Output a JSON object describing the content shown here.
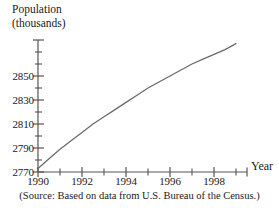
{
  "figure": {
    "y_axis_title_line1": "Population",
    "y_axis_title_line2": "(thousands)",
    "x_axis_title": "Year",
    "source_note": "(Source: Based on data from U.S. Bureau of the Census.)",
    "line_color": "#6b6b6b",
    "axis_color": "#555555",
    "text_color": "#1a1a1a"
  },
  "chart_data": {
    "type": "line",
    "title": "",
    "xlabel": "Year",
    "ylabel": "Population (thousands)",
    "xlim": [
      1990,
      1999.5
    ],
    "ylim": [
      2770,
      2880
    ],
    "grid": false,
    "legend": "none",
    "x_ticks_major": [
      1990,
      1992,
      1994,
      1996,
      1998
    ],
    "x_ticks_minor": [
      1991,
      1993,
      1995,
      1997,
      1999
    ],
    "x_tick_labels": [
      "1990",
      "1992",
      "1994",
      "1996",
      "1998"
    ],
    "y_ticks_major": [
      2770,
      2790,
      2810,
      2830,
      2850
    ],
    "y_ticks_minor": [
      2780,
      2800,
      2820,
      2840,
      2860,
      2870
    ],
    "y_tick_labels": [
      "2770",
      "2790",
      "2810",
      "2830",
      "2850"
    ],
    "series": [
      {
        "name": "Population",
        "x": [
          1990,
          1990.5,
          1991,
          1991.5,
          1992,
          1992.5,
          1993,
          1993.5,
          1994,
          1994.5,
          1995,
          1995.5,
          1996,
          1996.5,
          1997,
          1997.5,
          1998,
          1998.5,
          1999
        ],
        "values": [
          2773,
          2781,
          2789,
          2796,
          2803,
          2810,
          2816,
          2822,
          2828,
          2834,
          2840,
          2845,
          2850,
          2855,
          2860,
          2864,
          2868,
          2872,
          2877
        ]
      }
    ]
  }
}
